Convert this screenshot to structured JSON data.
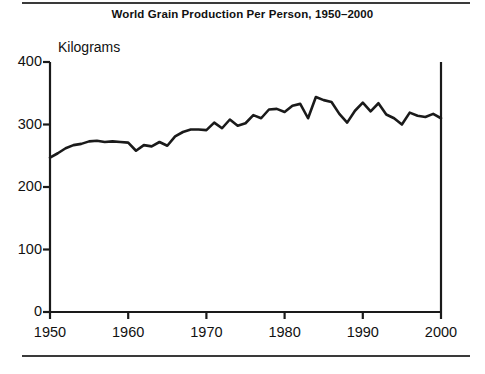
{
  "figure": {
    "title": "World Grain Production Per Person, 1950–2000",
    "y_axis_label": "Kilograms",
    "rules": {
      "top": "horizontal-rule",
      "bottom": "horizontal-rule"
    }
  },
  "chart_data": {
    "type": "line",
    "title": "World Grain Production Per Person, 1950–2000",
    "xlabel": "",
    "ylabel": "Kilograms",
    "xlim": [
      1950,
      2000
    ],
    "ylim": [
      0,
      400
    ],
    "xticks": [
      1950,
      1960,
      1970,
      1980,
      1990,
      2000
    ],
    "xtick_labels": [
      "1950",
      "1960",
      "1970",
      "1980",
      "1990",
      "2000"
    ],
    "yticks": [
      0,
      100,
      200,
      300,
      400
    ],
    "ytick_labels": [
      "0",
      "100",
      "200",
      "300",
      "400"
    ],
    "grid": false,
    "legend": null,
    "line_color": "#1a1a1a",
    "line_width": 2.6,
    "series": [
      {
        "name": "World grain production per person",
        "units": "kilograms",
        "x": [
          1950,
          1951,
          1952,
          1953,
          1954,
          1955,
          1956,
          1957,
          1958,
          1959,
          1960,
          1961,
          1962,
          1963,
          1964,
          1965,
          1966,
          1967,
          1968,
          1969,
          1970,
          1971,
          1972,
          1973,
          1974,
          1975,
          1976,
          1977,
          1978,
          1979,
          1980,
          1981,
          1982,
          1983,
          1984,
          1985,
          1986,
          1987,
          1988,
          1989,
          1990,
          1991,
          1992,
          1993,
          1994,
          1995,
          1996,
          1997,
          1998,
          1999,
          2000
        ],
        "values": [
          247,
          254,
          262,
          267,
          269,
          273,
          274,
          272,
          273,
          272,
          271,
          258,
          267,
          265,
          272,
          266,
          281,
          288,
          292,
          292,
          291,
          303,
          294,
          308,
          298,
          302,
          315,
          310,
          324,
          325,
          320,
          330,
          333,
          310,
          344,
          339,
          336,
          317,
          303,
          322,
          335,
          321,
          334,
          316,
          310,
          300,
          319,
          314,
          312,
          317,
          310
        ]
      }
    ]
  },
  "axes": {
    "y_ticks": [
      {
        "label": "400",
        "value": 400
      },
      {
        "label": "300",
        "value": 300
      },
      {
        "label": "200",
        "value": 200
      },
      {
        "label": "100",
        "value": 100
      },
      {
        "label": "0",
        "value": 0
      }
    ],
    "x_ticks": [
      {
        "label": "1950",
        "value": 1950
      },
      {
        "label": "1960",
        "value": 1960
      },
      {
        "label": "1970",
        "value": 1970
      },
      {
        "label": "1980",
        "value": 1980
      },
      {
        "label": "1990",
        "value": 1990
      },
      {
        "label": "2000",
        "value": 2000
      }
    ]
  }
}
